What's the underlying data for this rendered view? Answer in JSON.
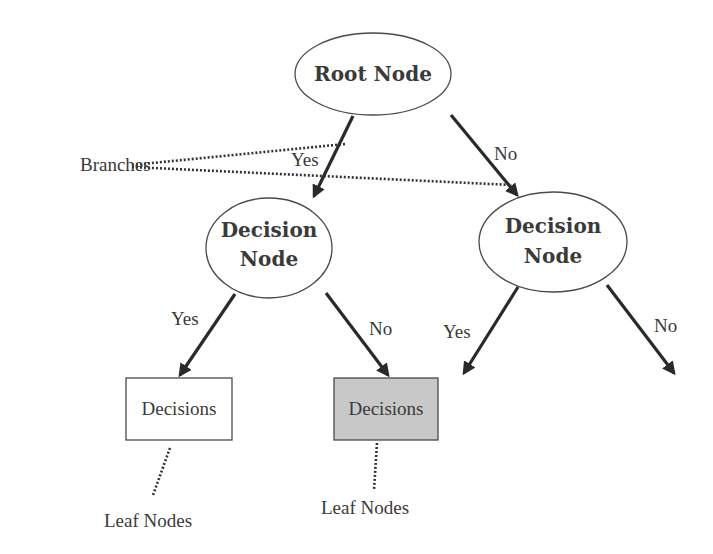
{
  "diagram": {
    "type": "decision-tree",
    "colors": {
      "stroke": "#2a2a2a",
      "leaf_highlight_fill": "#c8c8c8",
      "text": "#3a3a3a",
      "background": "#ffffff"
    },
    "root": {
      "label": "Root Node"
    },
    "decision_left": {
      "line1": "Decision",
      "line2": "Node"
    },
    "decision_right": {
      "line1": "Decision",
      "line2": "Node"
    },
    "edges": {
      "root_to_left": "Yes",
      "root_to_right": "No",
      "left_to_leaf1": "Yes",
      "left_to_leaf2": "No",
      "right_yes": "Yes",
      "right_no": "No"
    },
    "leaves": [
      {
        "label": "Decisions",
        "shaded": false
      },
      {
        "label": "Decisions",
        "shaded": true
      }
    ],
    "annotations": {
      "branches": "Branches",
      "leaf_nodes_1": "Leaf Nodes",
      "leaf_nodes_2": "Leaf Nodes"
    }
  }
}
